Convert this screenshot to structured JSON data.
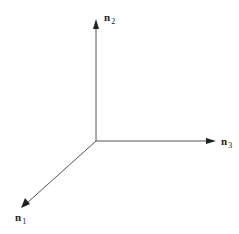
{
  "diagram": {
    "title": "",
    "type": "3D coordinate axes",
    "origin": {
      "x": 96,
      "y": 141
    },
    "axes": [
      {
        "id": "n1",
        "base": "n",
        "subscript": "1",
        "direction": "down-left",
        "tip": {
          "x": 22,
          "y": 207
        }
      },
      {
        "id": "n2",
        "base": "n",
        "subscript": "2",
        "direction": "up",
        "tip": {
          "x": 96,
          "y": 20
        }
      },
      {
        "id": "n3",
        "base": "n",
        "subscript": "3",
        "direction": "right",
        "tip": {
          "x": 215,
          "y": 141
        }
      }
    ],
    "colors": {
      "line": "#555555",
      "arrowhead": "#222222",
      "text": "#222222",
      "background": "#ffffff"
    }
  }
}
